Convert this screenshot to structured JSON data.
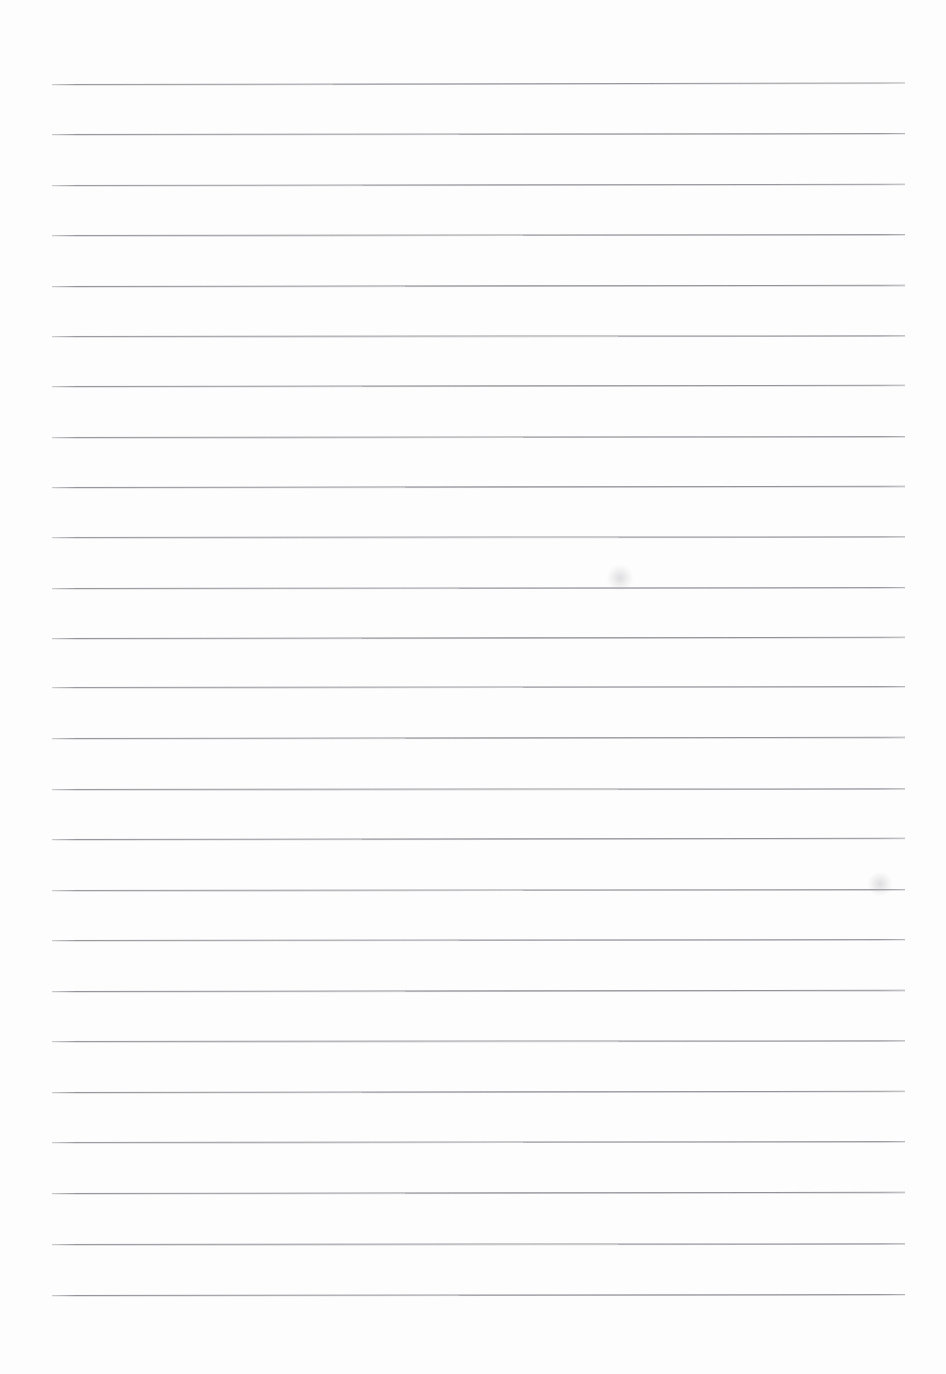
{
  "document": {
    "kind": "scanned-lined-paper",
    "title": "Blank lined notepad page",
    "page_width": 946,
    "page_height": 1374,
    "background_color": "#fdfdfd",
    "visible_text": "",
    "note": "No text, headings, labels or numbers appear anywhere on this page."
  },
  "ruling": {
    "line_color": "#8d8d93",
    "line_count": 25,
    "first_line_y": 84,
    "line_spacing": 50.4,
    "line_left_x": 52,
    "line_right_x": 905,
    "line_thickness": 1.5,
    "margins": {
      "left": 52,
      "right": 41,
      "top": 84,
      "bottom": 79
    },
    "lines": [
      {
        "index": 1,
        "y": 84,
        "left": 52,
        "right": 905,
        "tilt": -0.1,
        "opacity": 0.92
      },
      {
        "index": 2,
        "y": 134,
        "left": 52,
        "right": 905,
        "tilt": -0.07,
        "opacity": 0.95
      },
      {
        "index": 3,
        "y": 185,
        "left": 52,
        "right": 905,
        "tilt": -0.09,
        "opacity": 0.9
      },
      {
        "index": 4,
        "y": 235,
        "left": 52,
        "right": 905,
        "tilt": -0.06,
        "opacity": 0.93
      },
      {
        "index": 5,
        "y": 286,
        "left": 52,
        "right": 905,
        "tilt": -0.08,
        "opacity": 0.96
      },
      {
        "index": 6,
        "y": 336,
        "left": 52,
        "right": 905,
        "tilt": -0.05,
        "opacity": 0.91
      },
      {
        "index": 7,
        "y": 386,
        "left": 52,
        "right": 905,
        "tilt": -0.09,
        "opacity": 0.94
      },
      {
        "index": 8,
        "y": 437,
        "left": 52,
        "right": 905,
        "tilt": -0.06,
        "opacity": 0.92
      },
      {
        "index": 9,
        "y": 487,
        "left": 52,
        "right": 905,
        "tilt": -0.08,
        "opacity": 0.95
      },
      {
        "index": 10,
        "y": 537,
        "left": 52,
        "right": 905,
        "tilt": -0.05,
        "opacity": 0.9
      },
      {
        "index": 11,
        "y": 588,
        "left": 52,
        "right": 905,
        "tilt": -0.07,
        "opacity": 0.93
      },
      {
        "index": 12,
        "y": 638,
        "left": 52,
        "right": 905,
        "tilt": -0.09,
        "opacity": 0.96
      },
      {
        "index": 13,
        "y": 687,
        "left": 52,
        "right": 905,
        "tilt": -0.06,
        "opacity": 0.91
      },
      {
        "index": 14,
        "y": 738,
        "left": 52,
        "right": 905,
        "tilt": -0.08,
        "opacity": 0.94
      },
      {
        "index": 15,
        "y": 789,
        "left": 52,
        "right": 905,
        "tilt": -0.05,
        "opacity": 0.92
      },
      {
        "index": 16,
        "y": 839,
        "left": 52,
        "right": 905,
        "tilt": -0.09,
        "opacity": 0.95
      },
      {
        "index": 17,
        "y": 890,
        "left": 52,
        "right": 905,
        "tilt": -0.06,
        "opacity": 0.9
      },
      {
        "index": 18,
        "y": 940,
        "left": 52,
        "right": 905,
        "tilt": -0.07,
        "opacity": 0.93
      },
      {
        "index": 19,
        "y": 991,
        "left": 52,
        "right": 905,
        "tilt": -0.08,
        "opacity": 0.96
      },
      {
        "index": 20,
        "y": 1041,
        "left": 52,
        "right": 905,
        "tilt": -0.05,
        "opacity": 0.92
      },
      {
        "index": 21,
        "y": 1092,
        "left": 52,
        "right": 905,
        "tilt": -0.09,
        "opacity": 0.94
      },
      {
        "index": 22,
        "y": 1142,
        "left": 52,
        "right": 905,
        "tilt": -0.06,
        "opacity": 0.91
      },
      {
        "index": 23,
        "y": 1193,
        "left": 52,
        "right": 905,
        "tilt": -0.08,
        "opacity": 0.95
      },
      {
        "index": 24,
        "y": 1244,
        "left": 52,
        "right": 905,
        "tilt": -0.05,
        "opacity": 0.93
      },
      {
        "index": 25,
        "y": 1295,
        "left": 52,
        "right": 905,
        "tilt": -0.07,
        "opacity": 0.96
      }
    ]
  },
  "artifacts": {
    "smudges": [
      {
        "name": "scan-smudge-upper-right",
        "x": 620,
        "y": 578,
        "size": 26
      },
      {
        "name": "scan-smudge-lower-right",
        "x": 880,
        "y": 884,
        "size": 24
      }
    ]
  }
}
